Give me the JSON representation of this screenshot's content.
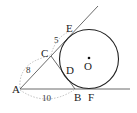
{
  "diagram": {
    "type": "geometry",
    "points": {
      "A": {
        "label": "A",
        "x": 20,
        "y": 89
      },
      "B": {
        "label": "B",
        "x": 75,
        "y": 89
      },
      "C": {
        "label": "C",
        "x": 51,
        "y": 56
      },
      "D": {
        "label": "D",
        "x": 64,
        "y": 72
      },
      "E": {
        "label": "E",
        "x": 72,
        "y": 31
      },
      "F": {
        "label": "F",
        "x": 89,
        "y": 89
      },
      "O": {
        "label": "O",
        "x": 89,
        "y": 59
      }
    },
    "circle": {
      "center": "O",
      "r": 29.5
    },
    "measurements": {
      "AC": "8",
      "CE": "5",
      "AB": "10"
    },
    "colors": {
      "line": "#333333",
      "dashed": "#999999",
      "text": "#222222"
    }
  }
}
